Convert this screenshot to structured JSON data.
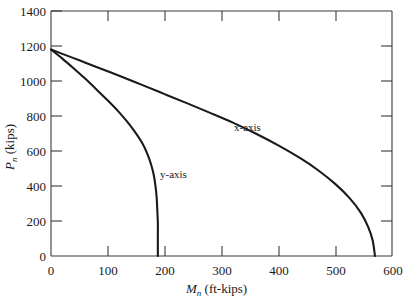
{
  "chart_data": {
    "type": "line",
    "title": "",
    "subtitle": "",
    "xlabel": "M",
    "xlabel_sub": "n",
    "xlabel_unit": "(ft-kips)",
    "ylabel": "P",
    "ylabel_sub": "n",
    "ylabel_unit": "(kips)",
    "xlim": [
      0,
      600
    ],
    "ylim": [
      0,
      1400
    ],
    "xticks": [
      0,
      100,
      200,
      300,
      400,
      500,
      600
    ],
    "xtick_labels": [
      "0",
      "100",
      "200",
      "300",
      "400",
      "500",
      "600"
    ],
    "yticks": [
      0,
      200,
      400,
      600,
      800,
      1000,
      1200,
      1400
    ],
    "ytick_labels": [
      "0",
      "200",
      "400",
      "600",
      "800",
      "1000",
      "1200",
      "1400"
    ],
    "grid": false,
    "legend_position": "inline-annotation",
    "axis_color": "#1a1a1a",
    "curve_color": "#1a1a1a",
    "background": "#ffffff",
    "series": [
      {
        "name": "x-axis",
        "label": "x-axis",
        "label_at": {
          "x": 310,
          "y": 655
        },
        "points": [
          [
            0,
            1180
          ],
          [
            20,
            1155
          ],
          [
            50,
            1118
          ],
          [
            80,
            1080
          ],
          [
            120,
            1030
          ],
          [
            160,
            978
          ],
          [
            200,
            925
          ],
          [
            240,
            872
          ],
          [
            280,
            818
          ],
          [
            320,
            762
          ],
          [
            360,
            700
          ],
          [
            400,
            632
          ],
          [
            440,
            556
          ],
          [
            470,
            490
          ],
          [
            500,
            412
          ],
          [
            525,
            332
          ],
          [
            545,
            248
          ],
          [
            558,
            166
          ],
          [
            566,
            88
          ],
          [
            570,
            0
          ]
        ]
      },
      {
        "name": "y-axis",
        "label": "y-axis",
        "label_at": {
          "x": 205,
          "y": 432
        },
        "points": [
          [
            0,
            1180
          ],
          [
            20,
            1128
          ],
          [
            40,
            1072
          ],
          [
            60,
            1014
          ],
          [
            80,
            952
          ],
          [
            100,
            888
          ],
          [
            118,
            828
          ],
          [
            134,
            768
          ],
          [
            148,
            708
          ],
          [
            160,
            648
          ],
          [
            169,
            588
          ],
          [
            176,
            524
          ],
          [
            181,
            460
          ],
          [
            184,
            396
          ],
          [
            186,
            330
          ],
          [
            187,
            262
          ],
          [
            188,
            190
          ],
          [
            188,
            110
          ],
          [
            188,
            0
          ]
        ]
      }
    ]
  },
  "figure": {
    "plot_left_px": 51,
    "plot_right_px": 392,
    "plot_top_px": 11,
    "plot_bottom_px": 256
  }
}
